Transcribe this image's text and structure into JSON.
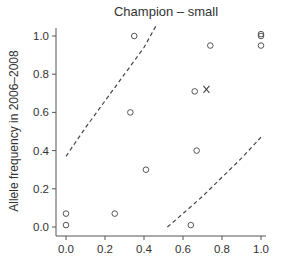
{
  "chart_data": {
    "type": "scatter",
    "title": "Champion – small",
    "xlabel": "",
    "ylabel": "Allele frequency in 2006–2008",
    "xlim": [
      0.0,
      1.0
    ],
    "ylim": [
      0.0,
      1.0
    ],
    "x_ticks": [
      "0.0",
      "0.2",
      "0.4",
      "0.6",
      "0.8",
      "1.0"
    ],
    "y_ticks": [
      "0.0",
      "0.2",
      "0.4",
      "0.6",
      "0.8",
      "1.0"
    ],
    "grid": false,
    "legend": null,
    "series": [
      {
        "name": "alleles",
        "marker": "circle",
        "points": [
          {
            "x": 0.35,
            "y": 1.0
          },
          {
            "x": 0.74,
            "y": 0.95
          },
          {
            "x": 1.0,
            "y": 1.0
          },
          {
            "x": 1.0,
            "y": 1.01
          },
          {
            "x": 1.0,
            "y": 0.95
          },
          {
            "x": 0.66,
            "y": 0.71
          },
          {
            "x": 0.33,
            "y": 0.6
          },
          {
            "x": 0.67,
            "y": 0.4
          },
          {
            "x": 0.41,
            "y": 0.3
          },
          {
            "x": 0.0,
            "y": 0.07
          },
          {
            "x": 0.25,
            "y": 0.07
          },
          {
            "x": 0.0,
            "y": 0.01
          },
          {
            "x": 0.64,
            "y": 0.01
          }
        ]
      },
      {
        "name": "highlighted",
        "marker": "x",
        "points": [
          {
            "x": 0.72,
            "y": 0.72
          }
        ]
      }
    ],
    "bounds": [
      {
        "name": "upper-bound",
        "style": "dashed",
        "points": [
          {
            "x": 0.0,
            "y": 0.37
          },
          {
            "x": 0.1,
            "y": 0.52
          },
          {
            "x": 0.2,
            "y": 0.66
          },
          {
            "x": 0.3,
            "y": 0.8
          },
          {
            "x": 0.4,
            "y": 0.94
          },
          {
            "x": 0.46,
            "y": 1.05
          }
        ]
      },
      {
        "name": "lower-bound",
        "style": "dashed",
        "points": [
          {
            "x": 0.52,
            "y": 0.0
          },
          {
            "x": 0.6,
            "y": 0.07
          },
          {
            "x": 0.7,
            "y": 0.16
          },
          {
            "x": 0.8,
            "y": 0.26
          },
          {
            "x": 0.9,
            "y": 0.36
          },
          {
            "x": 1.0,
            "y": 0.47
          }
        ]
      }
    ]
  }
}
